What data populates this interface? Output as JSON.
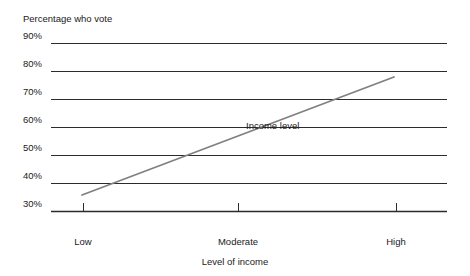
{
  "chart_data": {
    "type": "line",
    "title": "Percentage who vote",
    "xlabel": "Level of income",
    "ylabel": "",
    "categories": [
      "Low",
      "Moderate",
      "High"
    ],
    "x": [
      1,
      2,
      3
    ],
    "series": [
      {
        "name": "Income level",
        "values": [
          40,
          65,
          79
        ]
      }
    ],
    "annotations": [
      "Income level"
    ],
    "ylim": [
      30,
      90
    ],
    "y_ticks": [
      30,
      40,
      50,
      60,
      70,
      80,
      90
    ],
    "y_tick_labels": [
      "30%",
      "40%",
      "50%",
      "60%",
      "70%",
      "80%",
      "90%"
    ],
    "x_tick_labels": [
      "Low",
      "Moderate",
      "High"
    ],
    "grid": true,
    "legend": "none",
    "colors": {
      "series_line": "#808080",
      "gridline": "#2b2b2b",
      "axis": "#2b2b2b",
      "text": "#1a1a1a",
      "background": "#ffffff"
    }
  },
  "geometry": {
    "plot_left": 51,
    "plot_right": 447,
    "y_top_px": 43,
    "y_step_px": 28,
    "tick_x": [
      83,
      238,
      396
    ],
    "line_x1": 82,
    "line_y1": 195,
    "line_x2": 394,
    "line_y2": 77
  }
}
